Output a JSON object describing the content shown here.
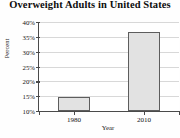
{
  "chart_data": {
    "type": "bar",
    "title": "Overweight Adults in United States",
    "xlabel": "Year",
    "ylabel": "Percent",
    "categories": [
      "1980",
      "2010"
    ],
    "values": [
      14.8,
      36.7
    ],
    "yticks": [
      "10%",
      "15%",
      "20%",
      "25%",
      "30%",
      "35%",
      "40%"
    ],
    "ytick_values": [
      10,
      15,
      20,
      25,
      30,
      35,
      40
    ],
    "ylim": [
      10,
      40
    ],
    "grid": true,
    "legend": "none",
    "colors": {
      "bar_fill": "#e2e2e2",
      "bar_edge": "#5d5d5d",
      "axis": "#4a4a4a",
      "grid": "#d8d8d8",
      "text": "#111111",
      "background": "#ffffff"
    }
  }
}
